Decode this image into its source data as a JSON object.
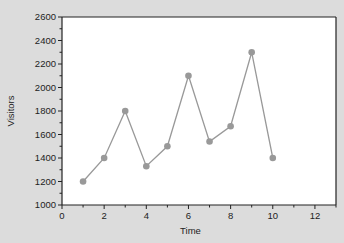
{
  "chart_data": {
    "type": "line",
    "title": "",
    "xlabel": "Time",
    "ylabel": "Visitors",
    "xlim": [
      0,
      13
    ],
    "ylim": [
      1000,
      2600
    ],
    "xticks": [
      0,
      2,
      4,
      6,
      8,
      10,
      12
    ],
    "yticks": [
      1000,
      1200,
      1400,
      1600,
      1800,
      2000,
      2200,
      2400,
      2600
    ],
    "grid": false,
    "legend": null,
    "series": [
      {
        "name": "Visitors",
        "x": [
          1,
          2,
          3,
          4,
          5,
          6,
          7,
          8,
          9,
          10
        ],
        "values": [
          1200,
          1400,
          1800,
          1330,
          1500,
          2100,
          1540,
          1670,
          2300,
          1400
        ],
        "color": "#999999",
        "marker_color": "#999999"
      }
    ]
  },
  "colors": {
    "background": "#dcdcdc",
    "plot_area": "#ffffff",
    "axis": "#222222",
    "line": "#999999"
  }
}
